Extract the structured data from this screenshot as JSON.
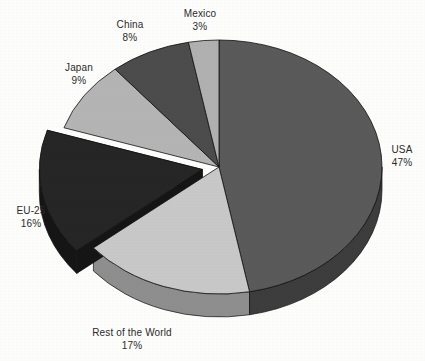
{
  "chart_data": {
    "type": "pie",
    "title": "",
    "subtitle": "",
    "xlabel": "",
    "ylabel": "",
    "style": "3d-exploded-pie",
    "legend_position": "none",
    "labels_outside": true,
    "value_unit": "percent",
    "categories": [
      "USA",
      "Rest of the World",
      "EU-25",
      "Japan",
      "China",
      "Mexico"
    ],
    "values": [
      47,
      17,
      16,
      9,
      8,
      3
    ],
    "slices": [
      {
        "name": "USA",
        "label": "USA",
        "value": 47,
        "value_text": "47%",
        "color": "#5a5a5a",
        "side_color": "#3d3d3d",
        "exploded": false
      },
      {
        "name": "Rest of the World",
        "label": "Rest of the World",
        "value": 17,
        "value_text": "17%",
        "color": "#c8c8c8",
        "side_color": "#8e8e8e",
        "exploded": false
      },
      {
        "name": "EU-25",
        "label": "EU-25",
        "value": 16,
        "value_text": "16%",
        "color": "#262626",
        "side_color": "#151515",
        "exploded": true
      },
      {
        "name": "Japan",
        "label": "Japan",
        "value": 9,
        "value_text": "9%",
        "color": "#b4b4b4",
        "side_color": "#7f7f7f",
        "exploded": false
      },
      {
        "name": "China",
        "label": "China",
        "value": 8,
        "value_text": "8%",
        "color": "#4c4c4c",
        "side_color": "#343434",
        "exploded": false
      },
      {
        "name": "Mexico",
        "label": "Mexico",
        "value": 3,
        "value_text": "3%",
        "color": "#b0b0b0",
        "side_color": "#7b7b7b",
        "exploded": false
      }
    ],
    "background_color": "#fdfdfc",
    "label_text_color": "#2b2b2b"
  },
  "labels": {
    "usa": {
      "name": "USA",
      "pct": "47%"
    },
    "row": {
      "name": "Rest of the World",
      "pct": "17%"
    },
    "eu25": {
      "name": "EU-25",
      "pct": "16%"
    },
    "japan": {
      "name": "Japan",
      "pct": "9%"
    },
    "china": {
      "name": "China",
      "pct": "8%"
    },
    "mexico": {
      "name": "Mexico",
      "pct": "3%"
    }
  }
}
